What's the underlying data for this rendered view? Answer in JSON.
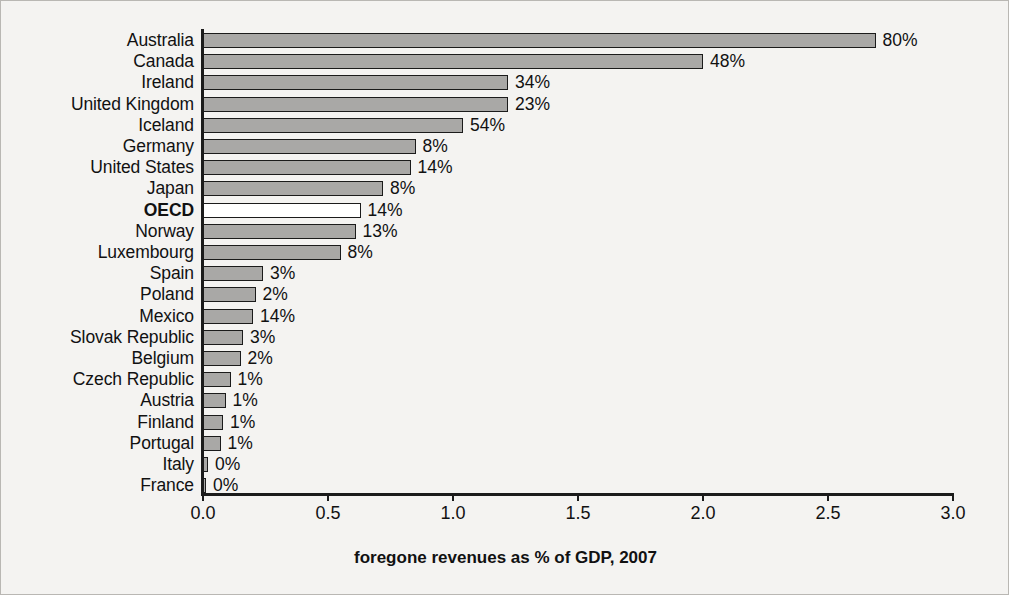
{
  "chart_data": {
    "type": "bar",
    "orientation": "horizontal",
    "title": "",
    "subtitle": "",
    "xlabel": "foregone revenues as % of GDP, 2007",
    "ylabel": "",
    "xlim": [
      0.0,
      3.0
    ],
    "xticks": [
      "0.0",
      "0.5",
      "1.0",
      "1.5",
      "2.0",
      "2.5",
      "3.0"
    ],
    "xtick_values": [
      0.0,
      0.5,
      1.0,
      1.5,
      2.0,
      2.5,
      3.0
    ],
    "grid": false,
    "legend": null,
    "categories": [
      "Australia",
      "Canada",
      "Ireland",
      "United Kingdom",
      "Iceland",
      "Germany",
      "United States",
      "Japan",
      "OECD",
      "Norway",
      "Luxembourg",
      "Spain",
      "Poland",
      "Mexico",
      "Slovak Republic",
      "Belgium",
      "Czech Republic",
      "Austria",
      "Finland",
      "Portugal",
      "Italy",
      "France"
    ],
    "values": [
      2.69,
      2.0,
      1.22,
      1.22,
      1.04,
      0.85,
      0.83,
      0.72,
      0.63,
      0.61,
      0.55,
      0.24,
      0.21,
      0.2,
      0.16,
      0.15,
      0.11,
      0.09,
      0.08,
      0.07,
      0.02,
      0.01
    ],
    "data_labels": [
      "80%",
      "48%",
      "34%",
      "23%",
      "54%",
      "8%",
      "14%",
      "8%",
      "14%",
      "13%",
      "8%",
      "3%",
      "2%",
      "14%",
      "3%",
      "2%",
      "1%",
      "1%",
      "1%",
      "1%",
      "0%",
      "0%"
    ],
    "highlighted_category": "OECD",
    "bar_fill_color": "#a9a8a6",
    "bar_highlight_fill_color": "#ffffff",
    "bar_edge_color": "#1b1b1b",
    "background_color": "#f4f3f1",
    "text_color": "#111111"
  }
}
